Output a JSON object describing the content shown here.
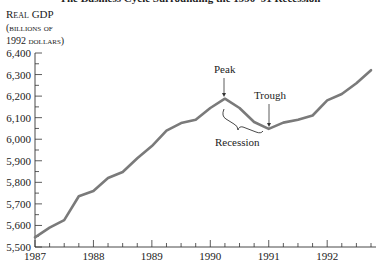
{
  "chart_data": {
    "type": "line",
    "title": "The Business Cycle Surrounding the 1990–91 Recession",
    "ylabel_lines": [
      "Real GDP",
      "(billions of",
      "1992 dollars)"
    ],
    "xlabel": "",
    "x_tick_labels": [
      "1987",
      "1988",
      "1989",
      "1990",
      "1991",
      "1992"
    ],
    "y_tick_labels": [
      "5,500",
      "5,600",
      "5,700",
      "5,800",
      "5,900",
      "6,000",
      "6,100",
      "6,200",
      "6,300",
      "6,400"
    ],
    "ylim": [
      5500,
      6400
    ],
    "xlim": [
      1987.0,
      1992.75
    ],
    "grid": false,
    "legend": null,
    "series": [
      {
        "name": "Real GDP",
        "color": "#7a7a7a",
        "x": [
          1987.0,
          1987.25,
          1987.5,
          1987.75,
          1988.0,
          1988.25,
          1988.5,
          1988.75,
          1989.0,
          1989.25,
          1989.5,
          1989.75,
          1990.0,
          1990.25,
          1990.5,
          1990.75,
          1991.0,
          1991.25,
          1991.5,
          1991.75,
          1992.0,
          1992.25,
          1992.5,
          1992.75
        ],
        "values": [
          5545,
          5590,
          5625,
          5735,
          5760,
          5820,
          5848,
          5912,
          5968,
          6040,
          6075,
          6090,
          6145,
          6188,
          6145,
          6080,
          6048,
          6077,
          6090,
          6110,
          6180,
          6210,
          6260,
          6320
        ]
      }
    ],
    "annotations": [
      {
        "text": "Peak",
        "x": 1990.25,
        "y": 6188,
        "type": "arrow-down"
      },
      {
        "text": "Trough",
        "x": 1991.0,
        "y": 6048,
        "type": "arrow-down"
      },
      {
        "text": "Recession",
        "x_start": 1990.25,
        "x_end": 1991.0,
        "type": "brace"
      }
    ]
  },
  "labels": {
    "title": "The Business Cycle Surrounding the 1990–91 Recession",
    "ylabel_line1": "Real GDP",
    "ylabel_line2": "(billions of",
    "ylabel_line3": "1992 dollars)",
    "peak": "Peak",
    "trough": "Trough",
    "recession": "Recession"
  }
}
